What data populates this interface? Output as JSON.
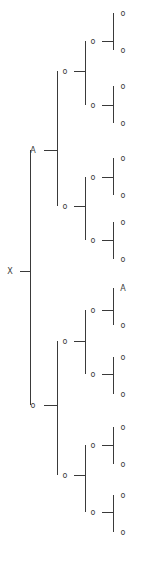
{
  "figure": {
    "type": "bracket-tree",
    "width": 142,
    "height": 561,
    "background_color": "#ffffff",
    "line_color": "#3a3a3a",
    "label_color": "#3a3a3a",
    "font_size": 8,
    "depth": 4,
    "leaf_count": 16,
    "node_count": 31,
    "orientation": "left-to-right",
    "default_node_label": "o",
    "special_labels": [
      "X",
      "A"
    ]
  },
  "columns": {
    "root_label_x": 10,
    "root_spine_x": 30,
    "level1_label_x": 33,
    "level1_spine_x": 57,
    "level2_label_x": 65,
    "level2_spine_x": 85,
    "level3_label_x": 93,
    "level3_spine_x": 113,
    "leaf_label_x": 123
  },
  "nodes": {
    "root": {
      "id": "root",
      "label": "X",
      "x": 10,
      "y": 271,
      "depth": 0
    },
    "level1": [
      {
        "id": "n-0",
        "label": "A",
        "x": 33,
        "y": 150,
        "depth": 1
      },
      {
        "id": "n-1",
        "label": "o",
        "x": 33,
        "y": 405,
        "depth": 1
      }
    ],
    "level2": [
      {
        "id": "n-00",
        "label": "o",
        "x": 65,
        "y": 71,
        "depth": 2
      },
      {
        "id": "n-01",
        "label": "o",
        "x": 65,
        "y": 206,
        "depth": 2
      },
      {
        "id": "n-10",
        "label": "o",
        "x": 65,
        "y": 341,
        "depth": 2
      },
      {
        "id": "n-11",
        "label": "o",
        "x": 65,
        "y": 475,
        "depth": 2
      }
    ],
    "level3": [
      {
        "id": "n-000",
        "label": "o",
        "x": 93,
        "y": 41,
        "depth": 3
      },
      {
        "id": "n-001",
        "label": "o",
        "x": 93,
        "y": 105,
        "depth": 3
      },
      {
        "id": "n-010",
        "label": "o",
        "x": 93,
        "y": 177,
        "depth": 3
      },
      {
        "id": "n-011",
        "label": "o",
        "x": 93,
        "y": 240,
        "depth": 3
      },
      {
        "id": "n-100",
        "label": "o",
        "x": 93,
        "y": 310,
        "depth": 3
      },
      {
        "id": "n-101",
        "label": "o",
        "x": 93,
        "y": 374,
        "depth": 3
      },
      {
        "id": "n-110",
        "label": "o",
        "x": 93,
        "y": 445,
        "depth": 3
      },
      {
        "id": "n-111",
        "label": "o",
        "x": 93,
        "y": 512,
        "depth": 3
      }
    ],
    "leaves": [
      {
        "id": "l-1",
        "label": "o",
        "x": 123,
        "y": 13,
        "depth": 4
      },
      {
        "id": "l-2",
        "label": "o",
        "x": 123,
        "y": 50,
        "depth": 4
      },
      {
        "id": "l-3",
        "label": "o",
        "x": 123,
        "y": 86,
        "depth": 4
      },
      {
        "id": "l-4",
        "label": "o",
        "x": 123,
        "y": 123,
        "depth": 4
      },
      {
        "id": "l-5",
        "label": "o",
        "x": 123,
        "y": 158,
        "depth": 4
      },
      {
        "id": "l-6",
        "label": "o",
        "x": 123,
        "y": 195,
        "depth": 4
      },
      {
        "id": "l-7",
        "label": "o",
        "x": 123,
        "y": 222,
        "depth": 4
      },
      {
        "id": "l-8",
        "label": "o",
        "x": 123,
        "y": 259,
        "depth": 4
      },
      {
        "id": "l-9",
        "label": "A",
        "x": 123,
        "y": 288,
        "depth": 4
      },
      {
        "id": "l-10",
        "label": "o",
        "x": 123,
        "y": 325,
        "depth": 4
      },
      {
        "id": "l-11",
        "label": "o",
        "x": 123,
        "y": 357,
        "depth": 4
      },
      {
        "id": "l-12",
        "label": "o",
        "x": 123,
        "y": 394,
        "depth": 4
      },
      {
        "id": "l-13",
        "label": "o",
        "x": 123,
        "y": 427,
        "depth": 4
      },
      {
        "id": "l-14",
        "label": "o",
        "x": 123,
        "y": 464,
        "depth": 4
      },
      {
        "id": "l-15",
        "label": "o",
        "x": 123,
        "y": 495,
        "depth": 4
      },
      {
        "id": "l-16",
        "label": "o",
        "x": 123,
        "y": 532,
        "depth": 4
      }
    ]
  },
  "brackets": [
    {
      "id": "b-root",
      "spine_x": 30,
      "top_y": 150,
      "bottom_y": 405,
      "tick_y": 271,
      "tick_from_x": 20,
      "tick_to_x": 30
    },
    {
      "id": "b-0",
      "spine_x": 57,
      "top_y": 71,
      "bottom_y": 206,
      "tick_y": 150,
      "tick_from_x": 44,
      "tick_to_x": 57
    },
    {
      "id": "b-1",
      "spine_x": 57,
      "top_y": 341,
      "bottom_y": 475,
      "tick_y": 405,
      "tick_from_x": 44,
      "tick_to_x": 57
    },
    {
      "id": "b-00",
      "spine_x": 85,
      "top_y": 41,
      "bottom_y": 105,
      "tick_y": 71,
      "tick_from_x": 74,
      "tick_to_x": 85
    },
    {
      "id": "b-01",
      "spine_x": 85,
      "top_y": 177,
      "bottom_y": 240,
      "tick_y": 206,
      "tick_from_x": 74,
      "tick_to_x": 85
    },
    {
      "id": "b-10",
      "spine_x": 85,
      "top_y": 310,
      "bottom_y": 374,
      "tick_y": 341,
      "tick_from_x": 74,
      "tick_to_x": 85
    },
    {
      "id": "b-11",
      "spine_x": 85,
      "top_y": 445,
      "bottom_y": 512,
      "tick_y": 475,
      "tick_from_x": 74,
      "tick_to_x": 85
    },
    {
      "id": "b-000",
      "spine_x": 113,
      "top_y": 13,
      "bottom_y": 50,
      "tick_y": 41,
      "tick_from_x": 102,
      "tick_to_x": 113
    },
    {
      "id": "b-001",
      "spine_x": 113,
      "top_y": 86,
      "bottom_y": 123,
      "tick_y": 105,
      "tick_from_x": 102,
      "tick_to_x": 113
    },
    {
      "id": "b-010",
      "spine_x": 113,
      "top_y": 158,
      "bottom_y": 195,
      "tick_y": 177,
      "tick_from_x": 102,
      "tick_to_x": 113
    },
    {
      "id": "b-011",
      "spine_x": 113,
      "top_y": 222,
      "bottom_y": 259,
      "tick_y": 240,
      "tick_from_x": 102,
      "tick_to_x": 113
    },
    {
      "id": "b-100",
      "spine_x": 113,
      "top_y": 288,
      "bottom_y": 325,
      "tick_y": 310,
      "tick_from_x": 102,
      "tick_to_x": 113
    },
    {
      "id": "b-101",
      "spine_x": 113,
      "top_y": 357,
      "bottom_y": 394,
      "tick_y": 374,
      "tick_from_x": 102,
      "tick_to_x": 113
    },
    {
      "id": "b-110",
      "spine_x": 113,
      "top_y": 427,
      "bottom_y": 464,
      "tick_y": 445,
      "tick_from_x": 102,
      "tick_to_x": 113
    },
    {
      "id": "b-111",
      "spine_x": 113,
      "top_y": 495,
      "bottom_y": 532,
      "tick_y": 512,
      "tick_from_x": 102,
      "tick_to_x": 113
    }
  ]
}
